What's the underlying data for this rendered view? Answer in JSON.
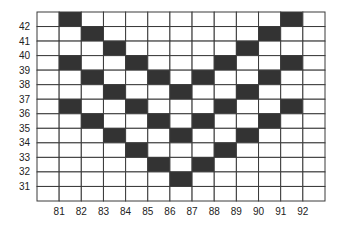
{
  "chart_data": {
    "type": "heatmap",
    "title": "",
    "xlabel": "",
    "ylabel": "",
    "x_ticks": [
      "81",
      "82",
      "83",
      "84",
      "85",
      "86",
      "87",
      "88",
      "89",
      "90",
      "91",
      "92"
    ],
    "y_ticks": [
      "42",
      "41",
      "40",
      "39",
      "38",
      "37",
      "36",
      "35",
      "34",
      "33",
      "32",
      "31"
    ],
    "columns": 13,
    "rows": 13,
    "fill_colors": {
      "on": "#333333",
      "off": "#ffffff"
    },
    "filled_cells_by_row": [
      [
        1,
        11
      ],
      [
        2,
        10
      ],
      [
        3,
        9
      ],
      [
        1,
        4,
        8,
        11
      ],
      [
        2,
        5,
        7,
        10
      ],
      [
        3,
        6,
        9
      ],
      [
        1,
        4,
        8,
        11
      ],
      [
        2,
        5,
        7,
        10
      ],
      [
        3,
        6,
        9
      ],
      [
        4,
        8
      ],
      [
        5,
        7
      ],
      [
        6
      ],
      []
    ]
  }
}
